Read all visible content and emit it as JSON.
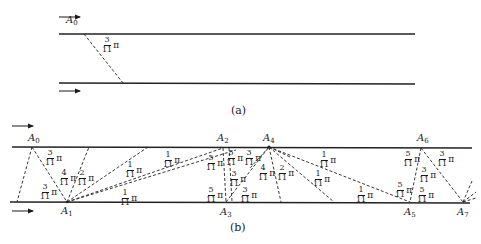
{
  "figure_a": {
    "caption": "(a)",
    "point_labels": [
      {
        "name": "A",
        "sub": "0"
      }
    ],
    "angle_labels": [
      {
        "num": "3",
        "den": "11",
        "sym": "π"
      }
    ]
  },
  "figure_b": {
    "caption": "(b)",
    "point_labels": [
      {
        "name": "A",
        "sub": "0"
      },
      {
        "name": "A",
        "sub": "1"
      },
      {
        "name": "A",
        "sub": "2"
      },
      {
        "name": "A",
        "sub": "3"
      },
      {
        "name": "A",
        "sub": "4"
      },
      {
        "name": "A",
        "sub": "5"
      },
      {
        "name": "A",
        "sub": "6"
      },
      {
        "name": "A",
        "sub": "7"
      }
    ],
    "angle_labels": [
      {
        "num": "3",
        "den": "11",
        "sym": "π"
      },
      {
        "num": "3",
        "den": "11",
        "sym": "π"
      },
      {
        "num": "4",
        "den": "11",
        "sym": "π"
      },
      {
        "num": "2",
        "den": "11",
        "sym": "π"
      },
      {
        "num": "1",
        "den": "11",
        "sym": "π"
      },
      {
        "num": "1",
        "den": "11",
        "sym": "π"
      },
      {
        "num": "1",
        "den": "11",
        "sym": "π"
      },
      {
        "num": "5",
        "den": "11",
        "sym": "π"
      },
      {
        "num": "5",
        "den": "11",
        "sym": "π"
      },
      {
        "num": "3",
        "den": "11",
        "sym": "π"
      },
      {
        "num": "3",
        "den": "11",
        "sym": "π"
      },
      {
        "num": "5",
        "den": "11",
        "sym": "π"
      },
      {
        "num": "3",
        "den": "11",
        "sym": "π"
      },
      {
        "num": "4",
        "den": "11",
        "sym": "π"
      },
      {
        "num": "2",
        "den": "11",
        "sym": "π"
      },
      {
        "num": "1",
        "den": "11",
        "sym": "π"
      },
      {
        "num": "1",
        "den": "11",
        "sym": "π"
      },
      {
        "num": "1",
        "den": "11",
        "sym": "π"
      },
      {
        "num": "5",
        "den": "11",
        "sym": "π"
      },
      {
        "num": "3",
        "den": "11",
        "sym": "π"
      },
      {
        "num": "3",
        "den": "11",
        "sym": "π"
      },
      {
        "num": "5",
        "den": "11",
        "sym": "π"
      },
      {
        "num": "5",
        "den": "11",
        "sym": "π"
      }
    ]
  }
}
